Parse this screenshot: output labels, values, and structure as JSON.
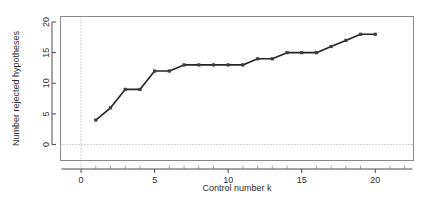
{
  "chart_data": {
    "type": "line",
    "title": "",
    "subtitle": "",
    "xlabel": "Control number k",
    "ylabel": "Number rejected hypotheses",
    "x": [
      1,
      2,
      3,
      4,
      5,
      6,
      7,
      8,
      9,
      10,
      11,
      12,
      13,
      14,
      15,
      16,
      17,
      18,
      19,
      20
    ],
    "values": [
      4,
      6,
      9,
      9,
      12,
      12,
      13,
      13,
      13,
      13,
      13,
      14,
      14,
      15,
      15,
      15,
      16,
      17,
      18,
      18
    ],
    "series": [
      {
        "name": "Number rejected hypotheses",
        "values": [
          4,
          6,
          9,
          9,
          12,
          12,
          13,
          13,
          13,
          13,
          13,
          14,
          14,
          15,
          15,
          15,
          16,
          17,
          18,
          18
        ]
      }
    ],
    "xlim": [
      -1.4,
      22.6
    ],
    "ylim": [
      -2.6,
      20.9
    ],
    "xticks": [
      0,
      5,
      10,
      15,
      20
    ],
    "xtick_labels": [
      "0",
      "5",
      "10",
      "15",
      "20"
    ],
    "xticks_minor": [
      1,
      2,
      3,
      4,
      6,
      7,
      8,
      9,
      11,
      12,
      13,
      14,
      16,
      17,
      18,
      19,
      21,
      22
    ],
    "yticks": [
      0,
      5,
      10,
      15,
      20
    ],
    "ytick_labels": [
      "0",
      "5",
      "10",
      "15",
      "20"
    ],
    "grid": false,
    "legend": false,
    "legend_position": "none",
    "marker": "square",
    "line_color": "#232323",
    "point_color": "#3c3c3c",
    "reference_lines": [
      {
        "name": "x-zero-reference",
        "orientation": "vertical",
        "value": 0,
        "style": "dotted",
        "color": "#9a9a9a"
      },
      {
        "name": "y-zero-reference",
        "orientation": "horizontal",
        "value": 0,
        "style": "dotted",
        "color": "#9a9a9a"
      }
    ],
    "axis_label_rotation": {
      "y_title": -90,
      "y_ticks": -90
    },
    "background_color": "#ffffff",
    "panel_border_color": "#8a8a8a"
  }
}
